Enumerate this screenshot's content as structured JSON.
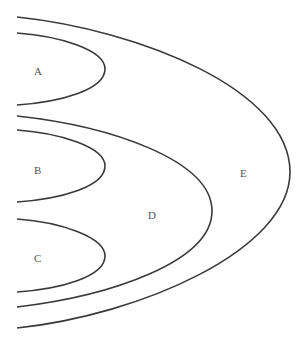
{
  "diagram": {
    "type": "nested-set-diagram",
    "regions": [
      {
        "id": "A",
        "label": "A",
        "parent": "E"
      },
      {
        "id": "B",
        "label": "B",
        "parent": "D"
      },
      {
        "id": "C",
        "label": "C",
        "parent": "D"
      },
      {
        "id": "D",
        "label": "D",
        "parent": "E"
      },
      {
        "id": "E",
        "label": "E",
        "parent": null
      }
    ],
    "colors": {
      "stroke": "#3a3a3a",
      "label": "#555555",
      "background": "#ffffff"
    }
  }
}
